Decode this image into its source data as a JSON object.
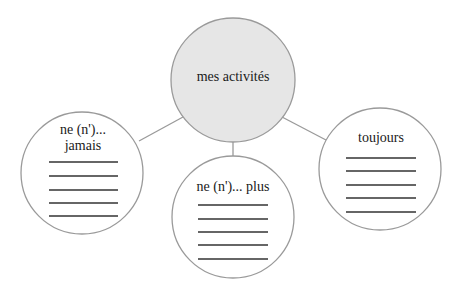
{
  "diagram": {
    "type": "mind-map",
    "center": {
      "label": "mes activités",
      "fill": "#e6e6e6"
    },
    "branches": [
      {
        "label_line1": "ne (n')...",
        "label_line2": "jamais",
        "blank_lines": 5
      },
      {
        "label_line1": "ne (n')... plus",
        "blank_lines": 5
      },
      {
        "label_line1": "toujours",
        "blank_lines": 5
      }
    ],
    "colors": {
      "stroke": "#9a9a9a",
      "rule": "#333333",
      "text": "#1a1a1a"
    }
  }
}
